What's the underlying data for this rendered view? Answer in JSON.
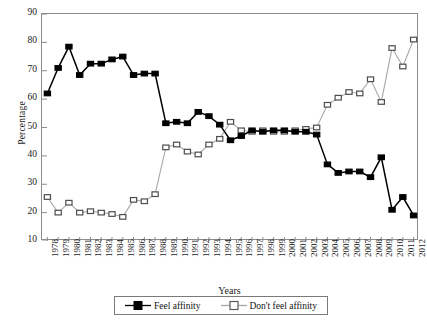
{
  "chart_data": {
    "type": "line",
    "title": "",
    "xlabel": "Years",
    "ylabel": "Percentage",
    "ylim": [
      10,
      90
    ],
    "ytick_step": 10,
    "yticks": [
      90,
      80,
      70,
      60,
      50,
      40,
      30,
      20,
      10
    ],
    "grid": false,
    "legend_position": "bottom",
    "categories": [
      "1978",
      "1979",
      "1980",
      "1981",
      "1982",
      "1983",
      "1984",
      "1985",
      "1986",
      "1987",
      "1988",
      "1989",
      "1990",
      "1991",
      "1992",
      "1993",
      "1994",
      "1995",
      "1996",
      "1997",
      "1998",
      "1999",
      "2000",
      "2001",
      "2002",
      "2003",
      "2004",
      "2005",
      "2006",
      "2007",
      "2008",
      "2009",
      "2010",
      "2011",
      "2012"
    ],
    "series": [
      {
        "name": "Feel affinity",
        "color": "#000000",
        "marker": "filled-square",
        "values": [
          62,
          71,
          78.5,
          68.5,
          72.5,
          72.5,
          74,
          75,
          68.5,
          69,
          69,
          51.5,
          52,
          51.5,
          55.5,
          54,
          51,
          45.5,
          47,
          49,
          48.5,
          49,
          49,
          48.5,
          48.5,
          47.5,
          37,
          34,
          34.5,
          34.5,
          32.5,
          39.5,
          21,
          25.5,
          19
        ]
      },
      {
        "name": "Don't feel affinity",
        "color": "#a8a8a8",
        "marker": "open-square",
        "values": [
          25.5,
          20,
          23.5,
          20,
          20.5,
          20,
          19.5,
          18.5,
          24.5,
          24,
          26.5,
          43,
          44,
          41.5,
          40.5,
          44,
          46,
          52,
          49,
          48.5,
          49,
          48.5,
          48.5,
          49,
          49.5,
          50,
          58,
          60.5,
          62.5,
          62,
          67,
          59,
          78,
          71.5,
          81
        ]
      }
    ]
  },
  "axes": {
    "ylabel_text": "Percentage",
    "xlabel_text": "Years"
  },
  "legend": {
    "entries": [
      {
        "label": "Feel affinity",
        "marker": "filled-square-icon"
      },
      {
        "label": "Don't feel affinity",
        "marker": "open-square-icon"
      }
    ]
  }
}
